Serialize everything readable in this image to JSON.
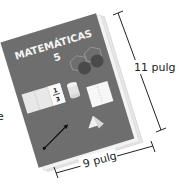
{
  "book": {
    "title": "MATEMÁTICAS",
    "grade": "5",
    "fraction_numerator": "1",
    "fraction_denominator": "3"
  },
  "dimensions": {
    "height_label": "11 pulg",
    "width_label": "9 pulg"
  },
  "edge_fragment": "e",
  "colors": {
    "cover": "#6e6e6e",
    "pages": "#f0f0f0",
    "line": "#222222"
  }
}
